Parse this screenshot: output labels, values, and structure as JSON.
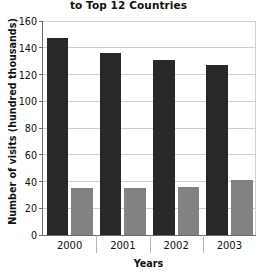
{
  "chart_data": {
    "type": "bar",
    "title": "to Top 12 Countries",
    "xlabel": "Years",
    "ylabel": "Number of visits (hundred thousands)",
    "categories": [
      "2000",
      "2001",
      "2002",
      "2003"
    ],
    "series": [
      {
        "name": "series-1",
        "color": "#282828",
        "values": [
          147,
          136,
          131,
          127
        ]
      },
      {
        "name": "series-2",
        "color": "#828282",
        "values": [
          35,
          35,
          36,
          41
        ]
      }
    ],
    "ylim": [
      0,
      160
    ],
    "ytick_labels": [
      "0",
      "20",
      "40",
      "60",
      "80",
      "100",
      "120",
      "140",
      "160"
    ],
    "ytick_values": [
      0,
      20,
      40,
      60,
      80,
      100,
      120,
      140,
      160
    ],
    "grid": true,
    "legend": "none"
  }
}
